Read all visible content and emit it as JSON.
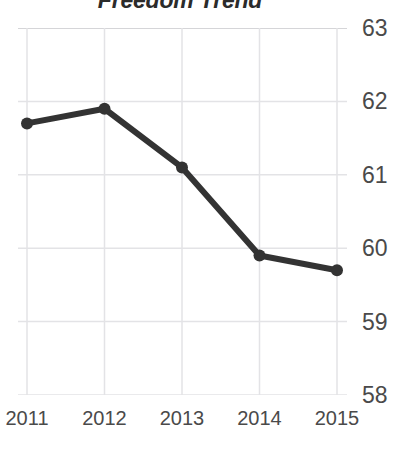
{
  "chart_data": {
    "type": "line",
    "title": "Freedom Trend",
    "xlabel": "",
    "ylabel": "",
    "categories": [
      "2011",
      "2012",
      "2013",
      "2014",
      "2015"
    ],
    "x": [
      2011,
      2012,
      2013,
      2014,
      2015
    ],
    "values": [
      61.7,
      61.9,
      61.1,
      59.9,
      59.7
    ],
    "series": [
      {
        "name": "Freedom Trend",
        "values": [
          61.7,
          61.9,
          61.1,
          59.9,
          59.7
        ]
      }
    ],
    "ylim": [
      58,
      63
    ],
    "yticks": [
      63,
      62,
      61,
      60,
      59,
      58
    ],
    "ytick_labels": [
      "63",
      "62",
      "61",
      "60",
      "59",
      "58"
    ],
    "xtick_labels": [
      "2011",
      "2012",
      "2013",
      "2014",
      "2015"
    ],
    "y_axis_position": "right",
    "grid": true,
    "legend": false,
    "legend_position": "none",
    "line_color": "#333333",
    "marker_color": "#333333",
    "grid_color": "#e3e3e6",
    "axis_color": "#d5d5d8",
    "title_color": "#2b2b2b",
    "tick_label_color": "#4a4a4a",
    "background_color": "#ffffff"
  }
}
